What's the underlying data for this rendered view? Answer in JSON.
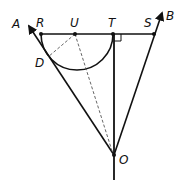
{
  "diagram": {
    "type": "geometry",
    "points": {
      "R": {
        "label": "R",
        "x": 41,
        "y": 34
      },
      "U": {
        "label": "U",
        "x": 75,
        "y": 34
      },
      "T": {
        "label": "T",
        "x": 113,
        "y": 34
      },
      "S": {
        "label": "S",
        "x": 154,
        "y": 34
      },
      "D": {
        "label": "D",
        "x": 48,
        "y": 58
      },
      "O": {
        "label": "O",
        "x": 114,
        "y": 155
      },
      "A": {
        "label": "A",
        "x": 28,
        "y": 25
      },
      "B": {
        "label": "B",
        "x": 163,
        "y": 12
      }
    },
    "labels": {
      "A": "A",
      "B": "B",
      "R": "R",
      "U": "U",
      "T": "T",
      "S": "S",
      "D": "D",
      "O": "O"
    },
    "elements": [
      {
        "kind": "segment",
        "from": "R",
        "to": "S",
        "style": "solid"
      },
      {
        "kind": "ray",
        "from": "O",
        "through": "A",
        "style": "solid",
        "arrow": true
      },
      {
        "kind": "ray",
        "from": "O",
        "through": "B",
        "style": "solid",
        "arrow": true
      },
      {
        "kind": "segment",
        "from": "T",
        "to": "O",
        "style": "solid",
        "extends_below_O": true
      },
      {
        "kind": "semicircle",
        "center": "U",
        "diameter": [
          "R",
          "T"
        ],
        "side": "below"
      },
      {
        "kind": "segment",
        "from": "U",
        "to": "D",
        "style": "dashed"
      },
      {
        "kind": "segment",
        "from": "U",
        "to": "O",
        "style": "dashed"
      },
      {
        "kind": "right-angle-mark",
        "at": "T"
      }
    ],
    "colors": {
      "stroke": "#111111",
      "background": "#ffffff"
    }
  }
}
